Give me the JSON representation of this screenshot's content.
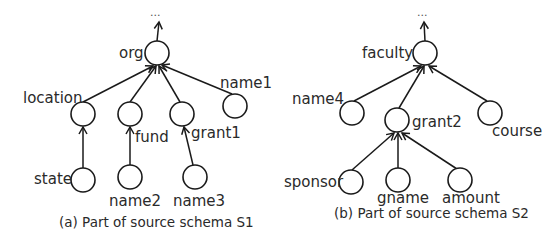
{
  "diagrams": [
    {
      "id": "s1",
      "caption": "(a) Part of source schema S1",
      "ellipsis": "...",
      "nodes": {
        "org": "org",
        "location": "location",
        "fund": "fund",
        "grant1": "grant1",
        "name1": "name1",
        "state": "state",
        "name2": "name2",
        "name3": "name3"
      },
      "edges": [
        [
          "org",
          "..."
        ],
        [
          "location",
          "org"
        ],
        [
          "fund",
          "org"
        ],
        [
          "grant1",
          "org"
        ],
        [
          "name1",
          "org"
        ],
        [
          "state",
          "location"
        ],
        [
          "name2",
          "fund"
        ],
        [
          "name3",
          "grant1"
        ]
      ]
    },
    {
      "id": "s2",
      "caption": "(b) Part of source schema S2",
      "ellipsis": "...",
      "nodes": {
        "faculty": "faculty",
        "name4": "name4",
        "grant2": "grant2",
        "course": "course",
        "sponsor": "sponsor",
        "gname": "gname",
        "amount": "amount"
      },
      "edges": [
        [
          "faculty",
          "..."
        ],
        [
          "name4",
          "faculty"
        ],
        [
          "grant2",
          "faculty"
        ],
        [
          "course",
          "faculty"
        ],
        [
          "sponsor",
          "grant2"
        ],
        [
          "gname",
          "grant2"
        ],
        [
          "amount",
          "grant2"
        ]
      ]
    }
  ]
}
